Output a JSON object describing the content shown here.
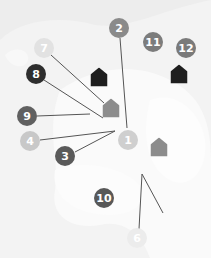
{
  "map": {
    "background_color": "#efefef",
    "land_color": "#fbfbfb",
    "markers": [
      {
        "label": "1",
        "x": 128,
        "y": 140,
        "color": "#cfcfcf"
      },
      {
        "label": "2",
        "x": 119,
        "y": 28,
        "color": "#8a8a8a"
      },
      {
        "label": "3",
        "x": 65,
        "y": 156,
        "color": "#5a5a5a"
      },
      {
        "label": "4",
        "x": 30,
        "y": 141,
        "color": "#c8c8c8"
      },
      {
        "label": "6",
        "x": 137,
        "y": 238,
        "color": "#ececec"
      },
      {
        "label": "7",
        "x": 44,
        "y": 48,
        "color": "#e2e2e2"
      },
      {
        "label": "8",
        "x": 36,
        "y": 74,
        "color": "#2e2e2e"
      },
      {
        "label": "9",
        "x": 27,
        "y": 116,
        "color": "#606060"
      },
      {
        "label": "10",
        "x": 104,
        "y": 198,
        "color": "#585858"
      },
      {
        "label": "11",
        "x": 153,
        "y": 42,
        "color": "#7c7c7c"
      },
      {
        "label": "12",
        "x": 186,
        "y": 48,
        "color": "#7a7a7a"
      }
    ],
    "houses": [
      {
        "name": "house-black-1",
        "x": 99,
        "y": 79,
        "color": "#1e1e1e"
      },
      {
        "name": "house-black-2",
        "x": 179,
        "y": 76,
        "color": "#1e1e1e"
      },
      {
        "name": "house-gray-1",
        "x": 111,
        "y": 110,
        "color": "#8c8c8c"
      },
      {
        "name": "house-gray-2",
        "x": 159,
        "y": 149,
        "color": "#8c8c8c"
      }
    ],
    "lines": [
      {
        "from": "7",
        "x1": 51,
        "y1": 55,
        "x2": 104,
        "y2": 103
      },
      {
        "from": "8",
        "x1": 44,
        "y1": 80,
        "x2": 103,
        "y2": 118
      },
      {
        "from": "9",
        "x1": 37,
        "y1": 116,
        "x2": 90,
        "y2": 114
      },
      {
        "from": "4",
        "x1": 40,
        "y1": 140,
        "x2": 115,
        "y2": 131
      },
      {
        "from": "3",
        "x1": 75,
        "y1": 152,
        "x2": 115,
        "y2": 131
      },
      {
        "from": "2",
        "x1": 120,
        "y1": 38,
        "x2": 127,
        "y2": 128
      },
      {
        "from": "6",
        "x1": 139,
        "y1": 229,
        "x2": 142,
        "y2": 174
      },
      {
        "from": "6b",
        "x1": 142,
        "y1": 174,
        "x2": 163,
        "y2": 213
      }
    ],
    "line_color": "#555555"
  }
}
